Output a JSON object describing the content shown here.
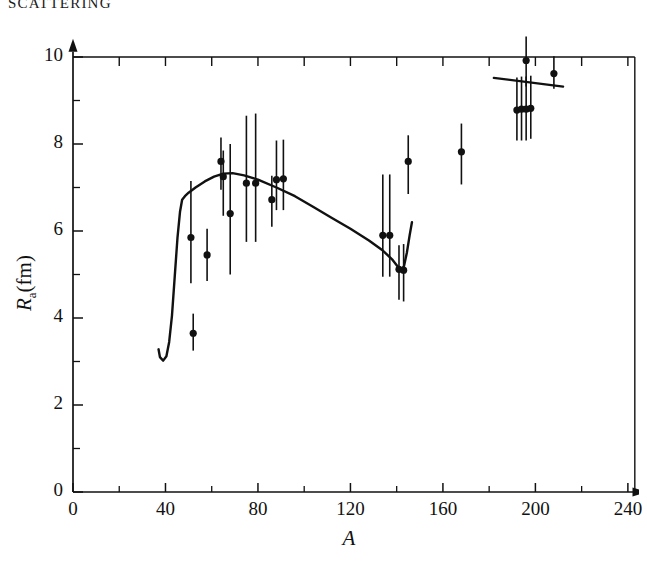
{
  "page": {
    "running_head": "SCATTERING",
    "background_color": "#ffffff",
    "ink_color": "#111111"
  },
  "chart_data": {
    "type": "scatter",
    "title": "",
    "xlabel": "A",
    "ylabel": "R_a (fm)",
    "ylabel_base": "R",
    "ylabel_sub": "a",
    "ylabel_unit": "(fm)",
    "xlim": [
      0,
      248
    ],
    "ylim": [
      0,
      10.35
    ],
    "xticks": [
      0,
      40,
      80,
      120,
      160,
      200,
      240
    ],
    "xticklabels": [
      "0",
      "40",
      "80",
      "120",
      "160",
      "200",
      "240"
    ],
    "xminorticks": [
      20,
      60,
      100,
      140,
      180,
      220
    ],
    "yticks": [
      0,
      2,
      4,
      6,
      8,
      10
    ],
    "yticklabels": [
      "0",
      "2",
      "4",
      "6",
      "8",
      "10"
    ],
    "yminorticks": [
      1,
      3,
      5,
      7,
      9
    ],
    "grid": false,
    "legend": null,
    "axis_arrows": [
      "x-right",
      "y-up"
    ],
    "marker": "filled-circle",
    "errorbars": "vertical",
    "points": [
      {
        "x": 51,
        "y": 5.85,
        "yerr_low": 1.05,
        "yerr_high": 1.3
      },
      {
        "x": 52,
        "y": 3.65,
        "yerr_low": 0.4,
        "yerr_high": 0.45
      },
      {
        "x": 58,
        "y": 5.45,
        "yerr_low": 0.6,
        "yerr_high": 0.6
      },
      {
        "x": 64,
        "y": 7.6,
        "yerr_low": 0.65,
        "yerr_high": 0.55
      },
      {
        "x": 65,
        "y": 7.25,
        "yerr_low": 0.9,
        "yerr_high": 0.6
      },
      {
        "x": 68,
        "y": 6.4,
        "yerr_low": 1.4,
        "yerr_high": 1.6
      },
      {
        "x": 75,
        "y": 7.1,
        "yerr_low": 1.35,
        "yerr_high": 1.55
      },
      {
        "x": 79,
        "y": 7.1,
        "yerr_low": 1.35,
        "yerr_high": 1.6
      },
      {
        "x": 86,
        "y": 6.72,
        "yerr_low": 0.62,
        "yerr_high": 0.55
      },
      {
        "x": 88,
        "y": 7.18,
        "yerr_low": 0.7,
        "yerr_high": 0.9
      },
      {
        "x": 91,
        "y": 7.2,
        "yerr_low": 0.72,
        "yerr_high": 0.9
      },
      {
        "x": 134,
        "y": 5.9,
        "yerr_low": 0.95,
        "yerr_high": 1.4
      },
      {
        "x": 137,
        "y": 5.9,
        "yerr_low": 0.95,
        "yerr_high": 1.4
      },
      {
        "x": 141,
        "y": 5.12,
        "yerr_low": 0.7,
        "yerr_high": 0.55
      },
      {
        "x": 143,
        "y": 5.1,
        "yerr_low": 0.72,
        "yerr_high": 0.6
      },
      {
        "x": 145,
        "y": 7.6,
        "yerr_low": 0.75,
        "yerr_high": 0.6
      },
      {
        "x": 168,
        "y": 7.82,
        "yerr_low": 0.75,
        "yerr_high": 0.65
      },
      {
        "x": 192,
        "y": 8.78,
        "yerr_low": 0.7,
        "yerr_high": 0.75
      },
      {
        "x": 194,
        "y": 8.8,
        "yerr_low": 0.72,
        "yerr_high": 0.75
      },
      {
        "x": 196,
        "y": 8.8,
        "yerr_low": 0.72,
        "yerr_high": 0.75
      },
      {
        "x": 198,
        "y": 8.82,
        "yerr_low": 0.7,
        "yerr_high": 0.75
      },
      {
        "x": 196,
        "y": 9.92,
        "yerr_low": 0.6,
        "yerr_high": 0.55
      },
      {
        "x": 208,
        "y": 9.62,
        "yerr_low": 0.35,
        "yerr_high": 0.4
      }
    ],
    "curves": [
      {
        "name": "main-theory-curve",
        "points": [
          [
            37.0,
            3.28
          ],
          [
            37.6,
            3.1
          ],
          [
            39.0,
            3.02
          ],
          [
            40.4,
            3.12
          ],
          [
            41.6,
            3.45
          ],
          [
            42.8,
            4.05
          ],
          [
            44.0,
            4.95
          ],
          [
            45.2,
            5.85
          ],
          [
            46.3,
            6.45
          ],
          [
            47.2,
            6.72
          ],
          [
            48.4,
            6.8
          ],
          [
            50.0,
            6.88
          ],
          [
            53.0,
            7.0
          ],
          [
            57.0,
            7.14
          ],
          [
            61.0,
            7.25
          ],
          [
            65.0,
            7.32
          ],
          [
            69.0,
            7.33
          ],
          [
            74.0,
            7.28
          ],
          [
            80.0,
            7.18
          ],
          [
            88.0,
            7.0
          ],
          [
            96.0,
            6.8
          ],
          [
            104.0,
            6.55
          ],
          [
            112.0,
            6.3
          ],
          [
            120.0,
            6.05
          ],
          [
            128.0,
            5.78
          ],
          [
            134.0,
            5.55
          ],
          [
            138.0,
            5.35
          ],
          [
            140.5,
            5.18
          ],
          [
            142.0,
            5.1
          ],
          [
            143.2,
            5.2
          ],
          [
            144.4,
            5.5
          ],
          [
            145.6,
            5.9
          ],
          [
            146.6,
            6.2
          ]
        ]
      },
      {
        "name": "short-segment-curve",
        "points": [
          [
            182.0,
            9.52
          ],
          [
            212.0,
            9.32
          ]
        ]
      }
    ]
  }
}
